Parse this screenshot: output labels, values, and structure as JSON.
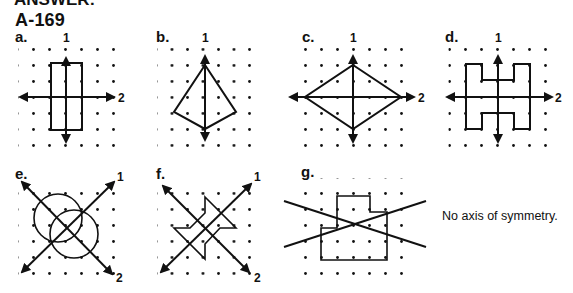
{
  "header": {
    "cut_text": "ANSWER:",
    "problem_id": "A-169"
  },
  "panels": [
    {
      "label": "a.",
      "axes": [
        "1",
        "2"
      ],
      "shape": "rectangle",
      "dots_origin": [
        20,
        49
      ]
    },
    {
      "label": "b.",
      "axes": [
        "1"
      ],
      "shape": "kite",
      "dots_origin": [
        159,
        49
      ]
    },
    {
      "label": "c.",
      "axes": [
        "1",
        "2"
      ],
      "shape": "rhombus",
      "dots_origin": [
        305,
        49
      ]
    },
    {
      "label": "d.",
      "axes": [
        "1",
        "2"
      ],
      "shape": "H-shape",
      "dots_origin": [
        450,
        49
      ]
    },
    {
      "label": "e.",
      "axes": [
        "1",
        "2"
      ],
      "shape": "two overlapping circles",
      "dots_origin": [
        20,
        182
      ]
    },
    {
      "label": "f.",
      "axes": [
        "1",
        "2"
      ],
      "shape": "arrow-like polygon",
      "dots_origin": [
        159,
        182
      ]
    },
    {
      "label": "g.",
      "axes": [],
      "shape": "irregular polygon",
      "dots_origin": [
        305,
        180
      ]
    }
  ],
  "note": "No axis of symmetry.",
  "colors": {
    "ink": "#111111",
    "background": "#ffffff"
  }
}
